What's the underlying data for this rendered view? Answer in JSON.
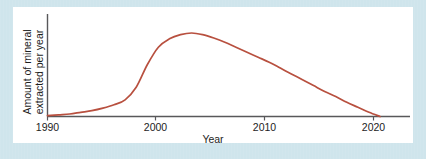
{
  "figure": {
    "background_color": "#cfe5ec",
    "panel_color": "#ffffff",
    "curve_color": "#b8503f",
    "axis_color": "#58585a"
  },
  "chart_data": {
    "type": "line",
    "title": "",
    "subtitle": "",
    "xlabel": "Year",
    "ylabel": "Amount of mineral extracted per year",
    "ylabel_lines": [
      "Amount of mineral",
      "extracted per year"
    ],
    "x_tick_labels": [
      "1990",
      "2000",
      "2010",
      "2020"
    ],
    "x_ticks": [
      1990,
      2000,
      2010,
      2020
    ],
    "y_tick_labels": [],
    "xlim": [
      1990,
      2022.7
    ],
    "ylim": [
      0,
      1.08
    ],
    "grid": false,
    "legend": null,
    "annotations": [],
    "series": [
      {
        "name": "Mineral extraction rate",
        "color": "#b8503f",
        "x": [
          1990,
          1991,
          1992,
          1993,
          1994,
          1995,
          1996,
          1997,
          1998,
          1999,
          2000,
          2001,
          2002,
          2003,
          2004,
          2005,
          2006,
          2007,
          2008,
          2009,
          2010,
          2011,
          2012,
          2013,
          2014,
          2015,
          2016,
          2017,
          2018,
          2019,
          2020
        ],
        "y": [
          0.01,
          0.02,
          0.03,
          0.05,
          0.07,
          0.1,
          0.14,
          0.2,
          0.35,
          0.62,
          0.83,
          0.93,
          0.98,
          1.0,
          0.98,
          0.94,
          0.89,
          0.83,
          0.77,
          0.71,
          0.65,
          0.58,
          0.51,
          0.44,
          0.37,
          0.3,
          0.24,
          0.17,
          0.11,
          0.05,
          0.0
        ]
      }
    ]
  }
}
